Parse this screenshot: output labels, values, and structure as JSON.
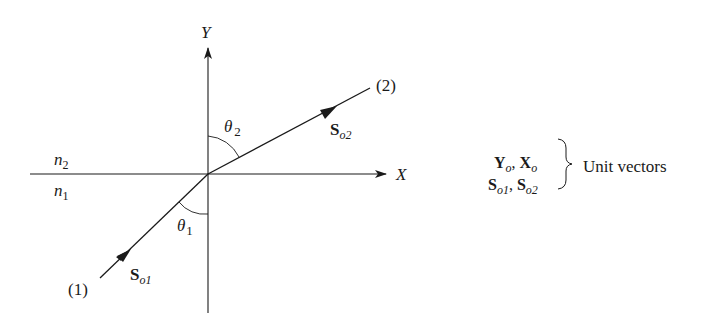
{
  "diagram": {
    "axes": {
      "x_label": "X",
      "y_label": "Y"
    },
    "media": {
      "upper": "n",
      "upper_sub": "2",
      "lower": "n",
      "lower_sub": "1"
    },
    "rays": [
      {
        "id": "1",
        "label": "(1)",
        "vector": "S",
        "vector_sub": "o1"
      },
      {
        "id": "2",
        "label": "(2)",
        "vector": "S",
        "vector_sub": "o2"
      }
    ],
    "angles": [
      {
        "symbol": "θ",
        "sub": "1"
      },
      {
        "symbol": "θ",
        "sub": "2"
      }
    ],
    "legend": {
      "line1": {
        "a": "Y",
        "a_sub": "o",
        "sep": ", ",
        "b": "X",
        "b_sub": "o"
      },
      "line2": {
        "a": "S",
        "a_sub": "o1",
        "sep": ", ",
        "b": "S",
        "b_sub": "o2"
      },
      "brace_label": "Unit vectors"
    },
    "colors": {
      "ink": "#1a1a1a",
      "background": "#ffffff"
    }
  }
}
